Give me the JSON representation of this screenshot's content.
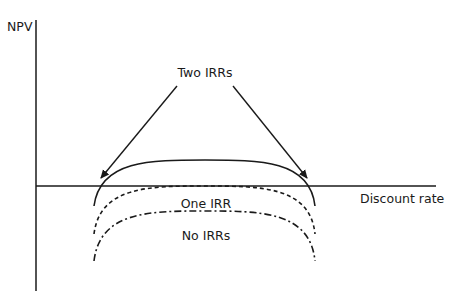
{
  "diagram": {
    "title": "",
    "axes": {
      "y_label": "NPV",
      "x_label": "Discount rate"
    },
    "annotations": {
      "two_irrs": "Two IRRs",
      "one_irr": "One IRR",
      "no_irrs": "No IRRs"
    },
    "curves": [
      {
        "name": "two-irrs-curve",
        "style": "solid",
        "crosses_axis": 2
      },
      {
        "name": "one-irr-curve",
        "style": "dashed",
        "crosses_axis": 1
      },
      {
        "name": "no-irrs-curve",
        "style": "dash-dot",
        "crosses_axis": 0
      }
    ],
    "colors": {
      "line": "#1a1a1a",
      "background": "#ffffff"
    }
  }
}
